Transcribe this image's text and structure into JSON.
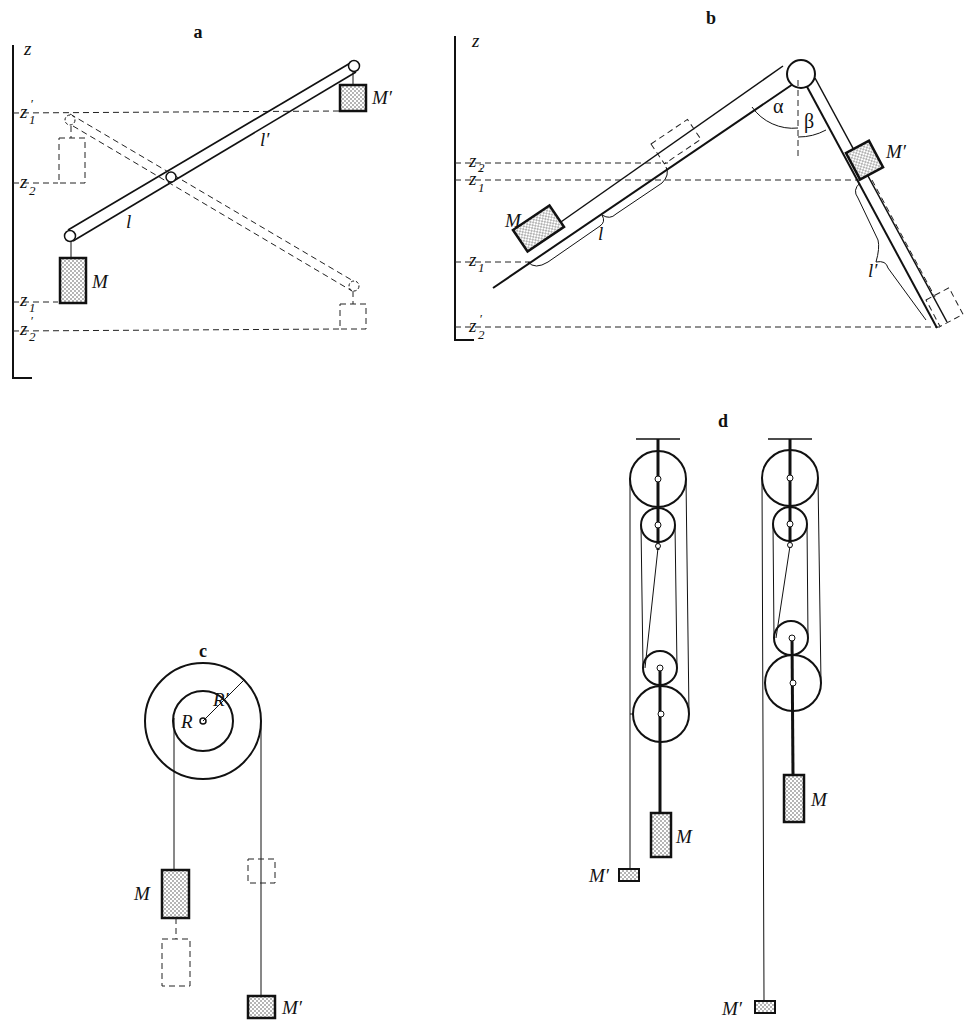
{
  "panels": {
    "a": {
      "title": "a",
      "axis_label": "z",
      "ticks": [
        {
          "main": "z",
          "sub": "1",
          "prime": "′"
        },
        {
          "main": "z",
          "sub": "2",
          "prime": ""
        },
        {
          "main": "z",
          "sub": "1",
          "prime": ""
        },
        {
          "main": "z",
          "sub": "2",
          "prime": "′"
        }
      ],
      "mass_left": "M",
      "mass_right": "M′",
      "arm_left": "l",
      "arm_right": "l′"
    },
    "b": {
      "title": "b",
      "axis_label": "z",
      "ticks": [
        {
          "main": "z",
          "sub": "2",
          "prime": ""
        },
        {
          "main": "z",
          "sub": "1",
          "prime": "′"
        },
        {
          "main": "z",
          "sub": "1",
          "prime": ""
        },
        {
          "main": "z",
          "sub": "2",
          "prime": "′"
        }
      ],
      "mass_left": "M",
      "mass_right": "M′",
      "angle_left": "α",
      "angle_right": "β",
      "length_left": "l",
      "length_right": "l′"
    },
    "c": {
      "title": "c",
      "radius_inner": "R",
      "radius_outer": "R′",
      "mass_left": "M",
      "mass_right": "M′"
    },
    "d": {
      "title": "d",
      "left_mass_heavy": "M",
      "left_mass_light": "M′",
      "right_mass_heavy": "M",
      "right_mass_light": "M′"
    }
  }
}
